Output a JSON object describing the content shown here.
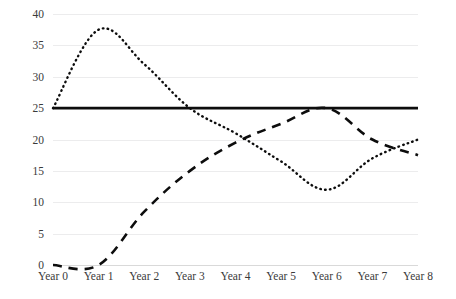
{
  "chart_data": {
    "type": "line",
    "title": "",
    "subtitle": "",
    "xlabel": "",
    "ylabel": "",
    "categories": [
      "Year 0",
      "Year 1",
      "Year 2",
      "Year 3",
      "Year 4",
      "Year 5",
      "Year 6",
      "Year 7",
      "Year 8"
    ],
    "x_tick_labels": [
      "Year 0",
      "Year 1",
      "Year 2",
      "Year 3",
      "Year 4",
      "Year 5",
      "Year 6",
      "Year 7",
      "Year 8"
    ],
    "y_tick_labels": [
      "0",
      "5",
      "10",
      "15",
      "20",
      "25",
      "30",
      "35",
      "40"
    ],
    "y_ticks": [
      0,
      5,
      10,
      15,
      20,
      25,
      30,
      35,
      40
    ],
    "ylim": [
      0,
      40
    ],
    "xlim": [
      0,
      8
    ],
    "grid": true,
    "grid_axis": "y",
    "legend": false,
    "legend_position": "none",
    "series": [
      {
        "name": "solid-flat-series",
        "style": "solid",
        "color": "#0d0d0d",
        "values": [
          25,
          25,
          25,
          25,
          25,
          25,
          25,
          25,
          25
        ]
      },
      {
        "name": "dashed-rising-series",
        "style": "dashed",
        "color": "#0d0d0d",
        "values": [
          0,
          0,
          8.5,
          15,
          19.5,
          22.5,
          25,
          20,
          17.5
        ]
      },
      {
        "name": "dotted-peaking-series",
        "style": "dotted",
        "color": "#0d0d0d",
        "values": [
          25,
          37.5,
          32,
          25,
          21,
          16.5,
          12,
          17,
          20
        ]
      }
    ]
  },
  "colors": {
    "background": "#ffffff",
    "gridline": "#ececed",
    "axis": "#d9d9d9",
    "tick_text": "#3a3a3a",
    "series_ink": "#0d0d0d"
  }
}
